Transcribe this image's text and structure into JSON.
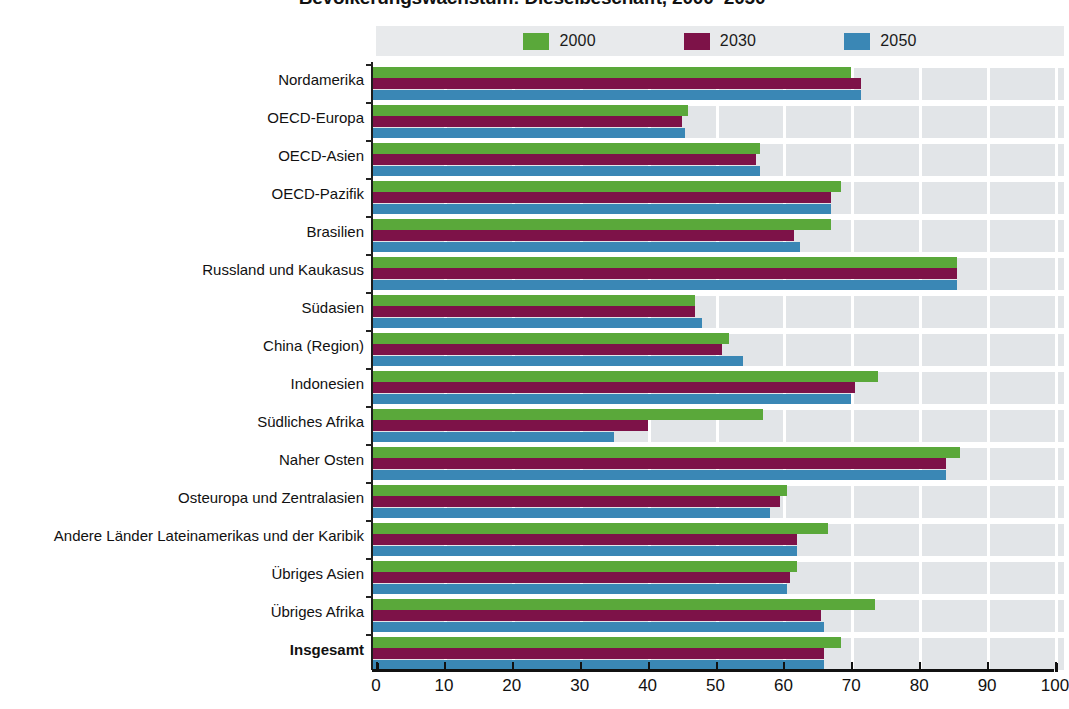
{
  "title": "Bevölkerungswachstum: Dieselbeschafft, 2000–2050",
  "legend": {
    "position": "top-center",
    "items": [
      {
        "label": "2000",
        "color": "#5aa83a"
      },
      {
        "label": "2030",
        "color": "#7d1248"
      },
      {
        "label": "2050",
        "color": "#3a87b5"
      }
    ]
  },
  "axis": {
    "x_ticks": [
      "0",
      "10",
      "20",
      "30",
      "40",
      "50",
      "60",
      "70",
      "80",
      "90",
      "100"
    ],
    "xlim": [
      0,
      100
    ]
  },
  "chart_data": {
    "type": "bar",
    "orientation": "horizontal",
    "title": "Bevölkerungswachstum: Dieselbeschafft, 2000–2050",
    "xlabel": "",
    "ylabel": "",
    "xlim": [
      0,
      100
    ],
    "grid": true,
    "legend_position": "top-center",
    "categories": [
      "Nordamerika",
      "OECD-Europa",
      "OECD-Asien",
      "OECD-Pazifik",
      "Brasilien",
      "Russland und Kaukasus",
      "Südasien",
      "China (Region)",
      "Indonesien",
      "Südliches Afrika",
      "Naher Osten",
      "Osteuropa und Zentralasien",
      "Andere Länder Lateinamerikas und der Karibik",
      "Übriges Asien",
      "Übriges Afrika",
      "Insgesamt"
    ],
    "emphasized_categories": [
      "Insgesamt"
    ],
    "series": [
      {
        "name": "2000",
        "color": "#5aa83a",
        "values": [
          70.0,
          46.0,
          56.5,
          68.5,
          67.0,
          85.5,
          47.0,
          52.0,
          74.0,
          57.0,
          86.0,
          60.5,
          66.5,
          62.0,
          73.5,
          68.5
        ]
      },
      {
        "name": "2030",
        "color": "#7d1248",
        "values": [
          71.5,
          45.0,
          56.0,
          67.0,
          61.5,
          85.5,
          47.0,
          51.0,
          70.5,
          40.0,
          84.0,
          59.5,
          62.0,
          61.0,
          65.5,
          66.0
        ]
      },
      {
        "name": "2050",
        "color": "#3a87b5",
        "values": [
          71.5,
          45.5,
          56.5,
          67.0,
          62.5,
          85.5,
          48.0,
          54.0,
          70.0,
          35.0,
          84.0,
          58.0,
          62.0,
          60.5,
          66.0,
          66.0
        ]
      }
    ]
  }
}
